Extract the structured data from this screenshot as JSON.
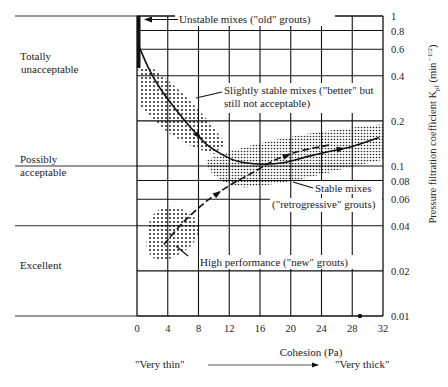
{
  "chart_data": {
    "type": "line",
    "title": "",
    "xlabel": "Cohesion (Pa)",
    "ylabel": "Pressure filtration coefficient K_pf (min^-1/2)",
    "ylabel_main": "Pressure filtration coefficient K",
    "ylabel_sub": "pf",
    "ylabel_unit": " (min",
    "ylabel_exp": " −1/2",
    "ylabel_close": ")",
    "xlim": [
      0,
      32
    ],
    "ylim": [
      0.01,
      1
    ],
    "yscale": "log",
    "grid": true,
    "x_ticks": [
      0,
      4,
      8,
      12,
      16,
      20,
      24,
      28,
      32
    ],
    "x_tick_labels": [
      "0",
      "4",
      "8",
      "12",
      "16",
      "20",
      "24",
      "28",
      "32"
    ],
    "y_ticks": [
      1,
      0.8,
      0.6,
      0.4,
      0.2,
      0.1,
      0.08,
      0.06,
      0.04,
      0.02,
      0.01
    ],
    "y_tick_labels": [
      "1",
      "0.8",
      "0.6",
      "0.4",
      "0.2",
      "0.1",
      "0.08",
      "0.06",
      "0.04",
      "0.02",
      "0.01"
    ],
    "series": [
      {
        "name": "Evolution from old to better grouts",
        "style": "solid",
        "points": [
          [
            0.3,
            0.62
          ],
          [
            1.5,
            0.45
          ],
          [
            3,
            0.33
          ],
          [
            5,
            0.24
          ],
          [
            7,
            0.18
          ],
          [
            9,
            0.14
          ],
          [
            11,
            0.12
          ],
          [
            13,
            0.108
          ],
          [
            16,
            0.103
          ],
          [
            19,
            0.105
          ],
          [
            22,
            0.115
          ],
          [
            25,
            0.125
          ],
          [
            28,
            0.135
          ],
          [
            31.5,
            0.155
          ]
        ]
      },
      {
        "name": "Evolution to high performance grouts",
        "style": "dashed",
        "points": [
          [
            3.5,
            0.03
          ],
          [
            6,
            0.042
          ],
          [
            9,
            0.058
          ],
          [
            12,
            0.074
          ],
          [
            15,
            0.09
          ],
          [
            18,
            0.11
          ],
          [
            21,
            0.125
          ],
          [
            25,
            0.138
          ]
        ]
      }
    ],
    "regions": [
      {
        "name": "Unstable mixes (\"old\" grouts)",
        "x": [
          0,
          0.7
        ],
        "y": [
          0.45,
          1
        ]
      },
      {
        "name": "Slightly stable mixes",
        "x_center": 6,
        "y_center": 0.25
      },
      {
        "name": "Stable mixes",
        "x_center": 21,
        "y_center": 0.11
      },
      {
        "name": "High performance",
        "x_center": 3.5,
        "y_center": 0.03
      }
    ],
    "annotations": [
      {
        "text": "Unstable mixes (\"old\" grouts)",
        "target": [
          0.5,
          0.9
        ]
      },
      {
        "text_lines": [
          "Slightly stable mixes (\"better\" but",
          "still not acceptable)"
        ],
        "target": [
          6,
          0.25
        ]
      },
      {
        "text_lines": [
          "Stable mixes",
          "(\"retrogressive\" grouts)"
        ],
        "target": [
          19,
          0.085
        ]
      },
      {
        "text": "High performance (\"new\" grouts)",
        "target": [
          3.5,
          0.032
        ]
      }
    ],
    "point_marker": {
      "x": 29,
      "y": 0.01
    },
    "left_zones": [
      {
        "label_lines": [
          "Totally",
          "unacceptable"
        ],
        "range": [
          0.2,
          1
        ]
      },
      {
        "label_lines": [
          "Possibly",
          "acceptable"
        ],
        "range": [
          0.04,
          0.1
        ]
      },
      {
        "label_lines": [
          "Excellent"
        ],
        "range": [
          0.01,
          0.04
        ]
      }
    ],
    "bottom_labels": {
      "left": "\"Very thin\"",
      "right": "\"Very thick\""
    }
  }
}
